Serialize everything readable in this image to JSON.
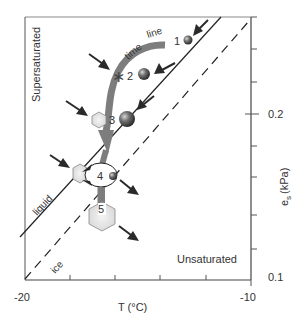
{
  "figure": {
    "region_labels": {
      "supersaturated": "Supersaturated",
      "unsaturated": "Unsaturated"
    },
    "curve_labels": {
      "liquid": "liquid",
      "ice": "ice"
    },
    "time_line_label": {
      "word1": "time",
      "word2": "line"
    },
    "stages": [
      {
        "num": "1",
        "type": "droplet"
      },
      {
        "num": "2",
        "type": "droplet",
        "extra": "ice-nucleus-asterisk"
      },
      {
        "num": "3",
        "type": "droplet",
        "extra": "ice-crystal"
      },
      {
        "num": "4",
        "type": "droplet",
        "extra": "ice-crystal"
      },
      {
        "num": "5",
        "type": "ice-crystal"
      }
    ],
    "x_axis": {
      "label": "T (°C)",
      "ticks": [
        "-20",
        "-10"
      ]
    },
    "y_axis": {
      "label_main": "e",
      "label_sub": "s",
      "label_unit": "(kPa)",
      "ticks": [
        "0.2",
        "0.1"
      ]
    }
  },
  "colors": {
    "axis": "#555555",
    "time_line": "#7a7a7a",
    "arrow": "#2a2a2a",
    "crystal_fill": "#e3e3e3",
    "droplet": "#555555"
  }
}
